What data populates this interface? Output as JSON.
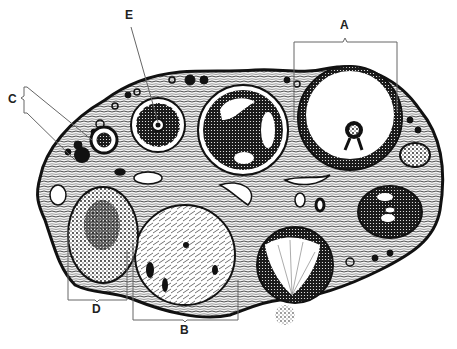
{
  "figure": {
    "labels": {
      "A": "A",
      "B": "B",
      "C": "C",
      "D": "D",
      "E": "E"
    }
  },
  "colors": {
    "ink": "#111111",
    "stroma": "#2a2a2a",
    "background": "#ffffff",
    "leader": "#666666"
  }
}
